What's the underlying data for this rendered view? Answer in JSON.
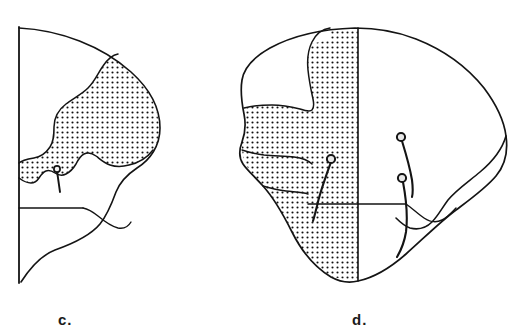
{
  "figure": {
    "caption_visible": false,
    "background_color": "#ffffff",
    "ink_color": "#141414",
    "stipple_color": "#111111",
    "panels": [
      {
        "id": "c",
        "label": "c.",
        "label_position": {
          "x": 58,
          "y": 311
        },
        "description": "left cross-section outline with stippled region, vertical cut edge on left, horizontal reference line and one pin marker",
        "features": {
          "vertical_cut_edge": true,
          "horizontal_reference_line": true,
          "stippled_region": true,
          "pin_markers": 1
        }
      },
      {
        "id": "d",
        "label": "d.",
        "label_position": {
          "x": 352,
          "y": 311
        },
        "description": "right full outline with stippled region on left half, vertical midline, horizontal reference line and three pin markers",
        "features": {
          "vertical_midline": true,
          "horizontal_reference_line": true,
          "stippled_region": true,
          "pin_markers": 3
        }
      }
    ],
    "pins": [
      {
        "panel": "c",
        "name": "pin-c-1",
        "head": {
          "x": 57,
          "y": 170
        },
        "tip": {
          "x": 60,
          "y": 191
        }
      },
      {
        "panel": "d",
        "name": "pin-d-1",
        "head": {
          "x": 330,
          "y": 159
        },
        "tip": {
          "x": 318,
          "y": 220
        }
      },
      {
        "panel": "d",
        "name": "pin-d-2",
        "head": {
          "x": 401,
          "y": 137
        },
        "tip": {
          "x": 412,
          "y": 196
        }
      },
      {
        "panel": "d",
        "name": "pin-d-3",
        "head": {
          "x": 402,
          "y": 178
        },
        "tip": {
          "x": 396,
          "y": 256
        }
      }
    ],
    "stipple": {
      "spacing_px": 5,
      "dot_radius_px": 1.05
    }
  }
}
